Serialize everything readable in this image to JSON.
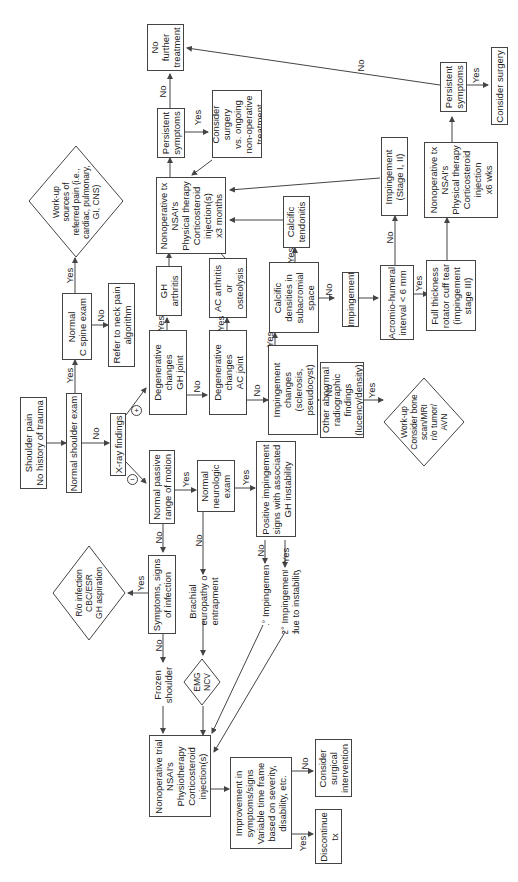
{
  "diagram": {
    "orientation": "rotated 90 degrees counter-clockwise",
    "nodes": {
      "shoulder_pain": "Shoulder pain\nNo history of trauma",
      "normal_shoulder_exam": "Normal shoulder exam",
      "normal_c_spine": "Normal\nC spine exam",
      "workup_referred": "Work-up\nsources of\nreferred pain (i.e.,\ncardiac, pulmonary,\nGI, CNS)",
      "neck_pain": "Refer to neck pain\nalgorithm",
      "xray": "X-ray findings",
      "degen_gh": "Degenerative\nchanges\nGH joint",
      "gh_arthritis": "GH\narthritis",
      "degen_ac": "Degenerative\nchanges\nAC joint",
      "ac_arthritis": "AC arthritis\nor\nosteolysis",
      "impingement_changes": "Impingement\nchanges\n(sclerosis,\npseudocyst)",
      "calcific_densities": "Calcific\ndensities in\nsubacromial\nspace",
      "calcific_tendonitis": "Calcific\ntendonitis",
      "impingement": "Impingement",
      "acromio_humeral": "Acromio-humeral\ninterval < 6 mm",
      "impingement_stage": "Impingement\n(Stage I, II)",
      "full_thickness": "Full thickness\nrotator cuff tear\n(impingement\nstage III)",
      "nonop_6wks": "Nonoperative tx\nNSAI's\nPhysical therapy\nCorticosteroid\ninjection\nx6 wks",
      "persistent_right": "Persistent\nsymptoms",
      "consider_surgery": "Consider surgery",
      "other_abnormal": "Other abnormal\nradiographic\nfindings\n(lucency/density)",
      "workup_bone": "Work-up\nConsider bone\nscan/MRI\nr/o tumor/\nAVN",
      "nonop_3months": "Nonoperative tx\nNSAI's\nPhysical therapy\nCorticosteroid\ninjection(s)\nx3 months",
      "persistent_top": "Persistent\nsymptoms",
      "no_further": "No\nfurther\ntreatment",
      "consider_surgery_vs": "Consider\nsurgery\nvs. ongoing\nnon-operative\ntreatment",
      "normal_prom": "Normal passive\nrange of motion",
      "normal_neuro": "Normal\nneurologic\nexam",
      "positive_impingement": "Positive impingement\nsigns with associated\nGH instability",
      "primary_impingement": "1° Impingement",
      "secondary_impingement": "2° Impingement\ndue to instability",
      "symptoms_infection": "Symptoms, signs\nof infection",
      "ro_infection": "R/o infection\nCBC/ESR\nGH aspiration",
      "brachial": "Brachial\nneuropathy or\nentrapment",
      "emg_ncv": "EMG\nNCV",
      "frozen_shoulder": "Frozen\nshoulder",
      "nonop_trial": "Nonoperative trial\nNSAI's\nPhysiotherapy\nCorticosteroid\ninjection(s)",
      "improvement": "Improvement in\nsymptoms/signs\nVariable time frame\nbased on severity,\ndisability, etc.",
      "discontinue": "Discontinue\ntx",
      "surgical_intervention": "Consider\nsurgical\nintervention"
    },
    "edge_labels": {
      "yes": "Yes",
      "no": "No",
      "plus": "+",
      "minus": "−"
    },
    "colors": {
      "line": "#444444",
      "text": "#222222",
      "background": "#ffffff"
    }
  }
}
